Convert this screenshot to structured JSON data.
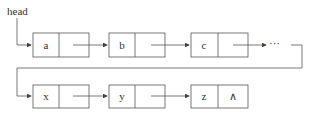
{
  "head_label": "head",
  "ellipsis": "···",
  "null_symbol": "∧",
  "nodes_row1": [
    {
      "data": "a"
    },
    {
      "data": "b"
    },
    {
      "data": "c"
    }
  ],
  "nodes_row2": [
    {
      "data": "x"
    },
    {
      "data": "y"
    },
    {
      "data": "z"
    }
  ],
  "colors": {
    "line": "#555555",
    "text": "#333333"
  }
}
